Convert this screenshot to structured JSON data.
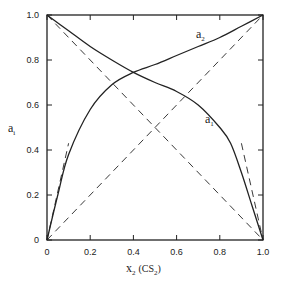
{
  "chart_data": {
    "type": "line",
    "title": "",
    "xlabel": "x2 (CS2)",
    "ylabel": "ai",
    "xlim": [
      0,
      1.0
    ],
    "ylim": [
      0,
      1.0
    ],
    "grid": false,
    "legend": "none (curves labeled inline: a2, a1)",
    "x_ticks": [
      "0",
      "0.2",
      "0.4",
      "0.6",
      "0.8",
      "1.0"
    ],
    "y_ticks": [
      "0",
      "0.2",
      "0.4",
      "0.6",
      "0.8",
      "1.0"
    ],
    "series": [
      {
        "name": "a1",
        "style": "solid",
        "x": [
          0,
          0.1,
          0.2,
          0.3,
          0.4,
          0.5,
          0.6,
          0.7,
          0.8,
          0.85,
          0.9,
          0.95,
          1.0
        ],
        "y": [
          1.0,
          0.93,
          0.86,
          0.8,
          0.745,
          0.7,
          0.66,
          0.6,
          0.5,
          0.43,
          0.3,
          0.15,
          0.0
        ]
      },
      {
        "name": "a2",
        "style": "solid",
        "x": [
          0,
          0.05,
          0.1,
          0.2,
          0.3,
          0.4,
          0.5,
          0.6,
          0.7,
          0.8,
          0.9,
          1.0
        ],
        "y": [
          0.0,
          0.2,
          0.38,
          0.58,
          0.69,
          0.745,
          0.78,
          0.82,
          0.86,
          0.9,
          0.95,
          1.0
        ]
      },
      {
        "name": "Raoult a1 (ideal)",
        "style": "dashed",
        "x": [
          0,
          1.0
        ],
        "y": [
          1.0,
          0.0
        ]
      },
      {
        "name": "Raoult a2 (ideal)",
        "style": "dashed",
        "x": [
          0,
          1.0
        ],
        "y": [
          0.0,
          1.0
        ]
      },
      {
        "name": "Henry tangent a2",
        "style": "dashed",
        "x": [
          0,
          0.1
        ],
        "y": [
          0.0,
          0.43
        ]
      },
      {
        "name": "Henry tangent a1",
        "style": "dashed",
        "x": [
          0.9,
          1.0
        ],
        "y": [
          0.43,
          0.0
        ]
      }
    ],
    "annotations": [
      {
        "text": "a2",
        "x": 0.62,
        "y": 0.9
      },
      {
        "text": "a1",
        "x": 0.68,
        "y": 0.52
      }
    ]
  },
  "labels": {
    "y_axis_main": "a",
    "y_axis_sub": "i",
    "x_axis_main": "x",
    "x_axis_sub": "2",
    "x_axis_paren_open": "(CS",
    "x_axis_paren_sub": "2",
    "x_axis_paren_close": ")",
    "curve_a2_main": "a",
    "curve_a2_sub": "2",
    "curve_a1_main": "a",
    "curve_a1_sub": "1"
  }
}
